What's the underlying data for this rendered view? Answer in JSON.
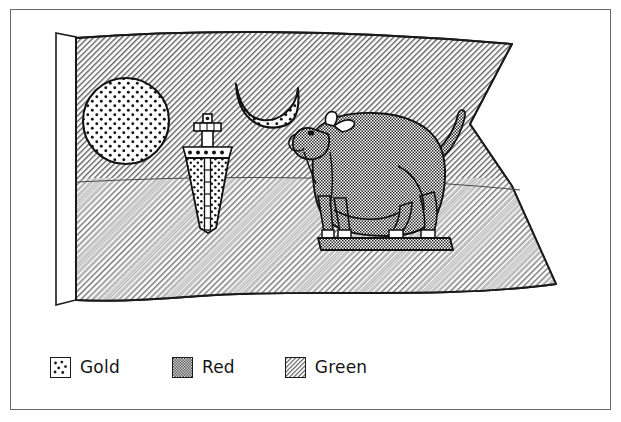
{
  "figure": {
    "description": "Line-art drawing of a forked (swallowtail) flag with a white hoist sleeve, bearing a dotted sun disc, a downward-pointing dagger, a crescent moon and a standing bull on a plinth.",
    "flag": {
      "field_pattern": "green",
      "hoist_sleeve": "white",
      "fold_line": true,
      "shape": "swallowtail"
    },
    "charges": [
      {
        "name": "sun-disc",
        "pattern": "gold",
        "label": "Sun disc"
      },
      {
        "name": "dagger",
        "pattern": "gold",
        "label": "Dagger"
      },
      {
        "name": "crescent-moon",
        "pattern": "gold",
        "label": "Crescent moon"
      },
      {
        "name": "bull",
        "pattern": "red",
        "label": "Bull"
      },
      {
        "name": "plinth",
        "pattern": "red",
        "label": "Plinth"
      }
    ]
  },
  "legend": {
    "title": "Key",
    "items": [
      {
        "label": "Gold",
        "pattern": "dots",
        "color": "#ffffff",
        "ink": "#1a1a1a"
      },
      {
        "label": "Red",
        "pattern": "checker",
        "color": "#8a8a8a",
        "ink": "#1a1a1a"
      },
      {
        "label": "Green",
        "pattern": "diagonal-hatch",
        "color": "#b9b9b9",
        "ink": "#1a1a1a"
      }
    ]
  },
  "colors": {
    "frame": "#6a6a6a",
    "ink": "#141414",
    "paper": "#ffffff"
  }
}
